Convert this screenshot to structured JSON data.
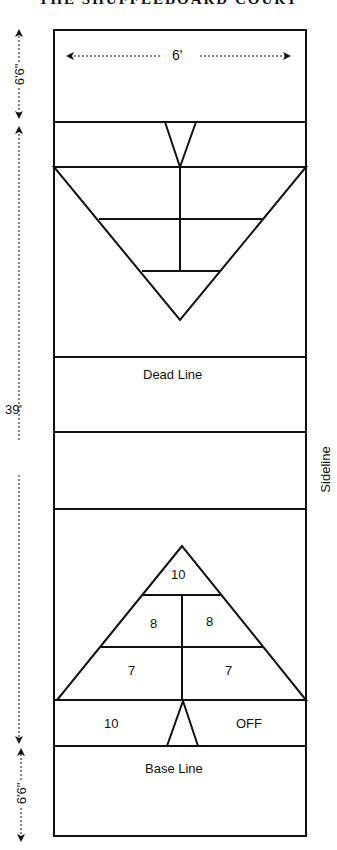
{
  "title": "THE SHUFFLEBOARD COURT",
  "dimensions": {
    "width_label": "6'",
    "top_zone_label": "6'6\"",
    "middle_label": "39'",
    "bottom_zone_label": "6'6\""
  },
  "labels": {
    "dead_line": "Dead Line",
    "base_line": "Base Line",
    "sideline": "Sideline"
  },
  "scoring": {
    "top_cell": "10",
    "middle_left": "8",
    "middle_right": "8",
    "bottom_left": "7",
    "bottom_right": "7",
    "ten_off_left": "10",
    "ten_off_right": "OFF"
  },
  "colors": {
    "line": "#111111",
    "background": "#ffffff"
  }
}
